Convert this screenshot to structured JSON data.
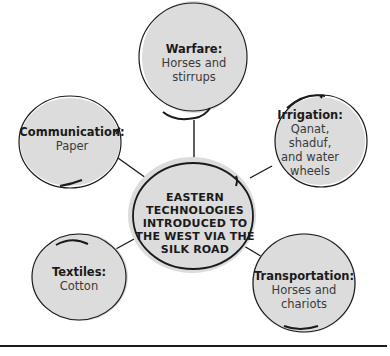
{
  "diagram": {
    "type": "concept-map",
    "center": {
      "label": "EASTERN TECHNOLOGIES INTRODUCED TO THE WEST VIA THE SILK ROAD",
      "lines": [
        "EASTERN",
        "TECHNOLOGIES",
        "INTRODUCED TO",
        "THE WEST VIA THE",
        "SILK ROAD"
      ]
    },
    "nodes": [
      {
        "id": "warfare",
        "title": "Warfare:",
        "description_lines": [
          "Horses and",
          "stirrups"
        ]
      },
      {
        "id": "communication",
        "title": "Communication:",
        "description_lines": [
          "Paper"
        ]
      },
      {
        "id": "irrigation",
        "title": "Irrigation:",
        "description_lines": [
          "Qanat, shaduf,",
          "and water",
          "wheels"
        ]
      },
      {
        "id": "textiles",
        "title": "Textiles:",
        "description_lines": [
          "Cotton"
        ]
      },
      {
        "id": "transportation",
        "title": "Transportation:",
        "description_lines": [
          "Horses and",
          "chariots"
        ]
      }
    ],
    "colors": {
      "bubble_fill": "#dcdcdc",
      "bubble_stroke": "#1a1a1a",
      "connector": "#1a1a1a",
      "text": "#1a1a1a"
    }
  }
}
